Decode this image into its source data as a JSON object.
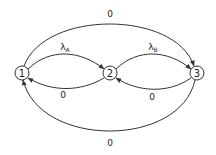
{
  "diagram": {
    "type": "state-transition",
    "nodes": [
      {
        "id": "1",
        "label": "1",
        "x": 22,
        "y": 73
      },
      {
        "id": "2",
        "label": "2",
        "x": 110,
        "y": 73
      },
      {
        "id": "3",
        "label": "3",
        "x": 197,
        "y": 73
      }
    ],
    "edges": [
      {
        "from": "1",
        "to": "2",
        "label": "λ",
        "subscript": "A",
        "position": "upper-inner"
      },
      {
        "from": "2",
        "to": "3",
        "label": "λ",
        "subscript": "B",
        "position": "upper-inner"
      },
      {
        "from": "2",
        "to": "1",
        "label": "0",
        "position": "lower-inner"
      },
      {
        "from": "3",
        "to": "2",
        "label": "0",
        "position": "lower-inner"
      },
      {
        "from": "1",
        "to": "3",
        "label": "0",
        "position": "top-outer"
      },
      {
        "from": "3",
        "to": "1",
        "label": "0",
        "position": "bottom-outer"
      }
    ],
    "colors": {
      "stroke": "#333333",
      "background": "#ffffff",
      "text": "#222222"
    }
  }
}
